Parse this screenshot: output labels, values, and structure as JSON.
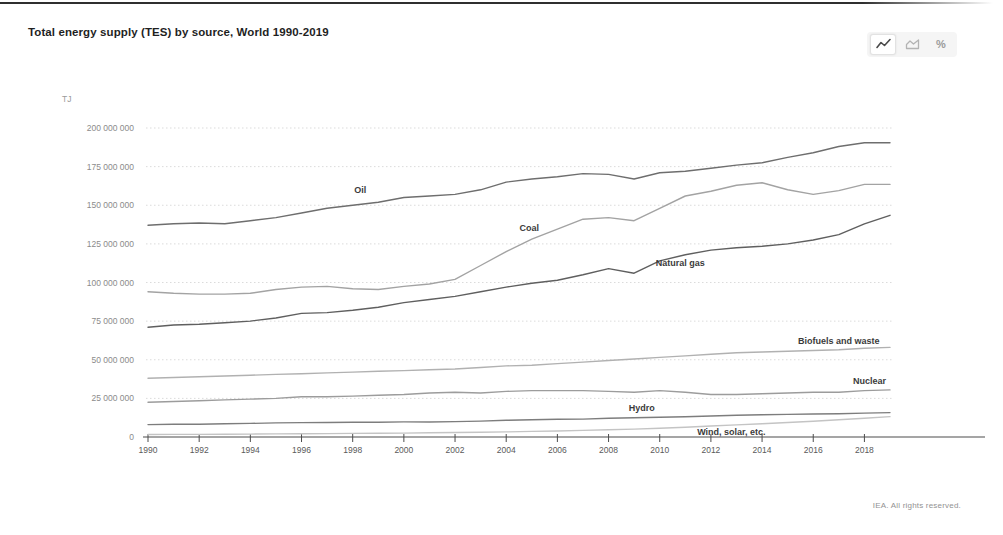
{
  "header": {
    "title": "Total energy supply (TES) by source, World 1990-2019"
  },
  "toolbar": {
    "percent_glyph": "%",
    "options": [
      {
        "id": "line-chart",
        "icon": "line-chart-icon",
        "selected": true
      },
      {
        "id": "area-chart",
        "icon": "area-chart-icon",
        "selected": false
      },
      {
        "id": "percent-chart",
        "icon": "percent-icon",
        "selected": false
      }
    ]
  },
  "footer": {
    "copyright": "IEA. All rights reserved."
  },
  "chart_data": {
    "type": "line",
    "title": "Total energy supply (TES) by source, World 1990-2019",
    "xlabel": "",
    "ylabel": "TJ",
    "values_unit": "million TJ",
    "xlim": [
      1990,
      2019
    ],
    "ylim": [
      0,
      200
    ],
    "grid": "horizontal-dotted",
    "legend": "inline-labels",
    "years": [
      1990,
      1991,
      1992,
      1993,
      1994,
      1995,
      1996,
      1997,
      1998,
      1999,
      2000,
      2001,
      2002,
      2003,
      2004,
      2005,
      2006,
      2007,
      2008,
      2009,
      2010,
      2011,
      2012,
      2013,
      2014,
      2015,
      2016,
      2017,
      2018,
      2019
    ],
    "x_ticks": [
      1990,
      1992,
      1994,
      1996,
      1998,
      2000,
      2002,
      2004,
      2006,
      2008,
      2010,
      2012,
      2014,
      2016,
      2018
    ],
    "y_ticks": [
      {
        "value": 200,
        "label": "200 000 000"
      },
      {
        "value": 175,
        "label": "175 000 000"
      },
      {
        "value": 150,
        "label": "150 000 000"
      },
      {
        "value": 125,
        "label": "125 000 000"
      },
      {
        "value": 100,
        "label": "100 000 000"
      },
      {
        "value": 75,
        "label": "75 000 000"
      },
      {
        "value": 50,
        "label": "50 000 000"
      },
      {
        "value": 25,
        "label": "25 000 000"
      },
      {
        "value": 0,
        "label": "0"
      }
    ],
    "series": [
      {
        "id": "oil",
        "name": "Oil",
        "color": "#6e6e6e",
        "label": {
          "year": 1998.3,
          "dy": -11
        },
        "values": [
          137,
          138,
          138.5,
          138,
          140,
          142,
          145,
          148,
          150,
          152,
          155,
          156,
          157,
          160,
          165,
          167,
          168.5,
          170.5,
          170,
          167,
          171,
          172,
          174,
          176,
          177.5,
          181,
          184,
          188,
          190.5,
          190.5
        ]
      },
      {
        "id": "coal",
        "name": "Coal",
        "color": "#a3a3a3",
        "label": {
          "year": 2004.9,
          "dy": -9
        },
        "values": [
          94,
          93,
          92.5,
          92.5,
          93,
          95.5,
          97,
          97.5,
          96,
          95.5,
          97.5,
          99,
          102,
          111,
          120,
          128,
          134.5,
          141,
          142,
          140,
          148,
          156,
          159,
          163,
          164.5,
          160,
          157,
          159.5,
          163.5,
          163.5
        ]
      },
      {
        "id": "natural-gas",
        "name": "Natural gas",
        "color": "#5f5f5f",
        "label": {
          "year": 2010.8,
          "dy": 10
        },
        "values": [
          71,
          72.5,
          73,
          74,
          75,
          77,
          80,
          80.5,
          82,
          84,
          87,
          89,
          91,
          94,
          97,
          99.5,
          101.5,
          105,
          109,
          106,
          114,
          118,
          121,
          122.5,
          123.5,
          125,
          127.5,
          131,
          138,
          143.5
        ]
      },
      {
        "id": "biofuels-waste",
        "name": "Biofuels and waste",
        "color": "#b1b1b1",
        "label": {
          "year": 2017,
          "dy": -6
        },
        "values": [
          38,
          38.5,
          39,
          39.5,
          40,
          40.5,
          41,
          41.5,
          42,
          42.5,
          43,
          43.5,
          44,
          45,
          46,
          46.5,
          47.5,
          48.5,
          49.5,
          50.5,
          51.5,
          52.5,
          53.5,
          54.5,
          55,
          55.5,
          56,
          56.5,
          57.5,
          58
        ]
      },
      {
        "id": "nuclear",
        "name": "Nuclear",
        "color": "#9c9c9c",
        "label": {
          "year": 2018.2,
          "dy": -6
        },
        "values": [
          22.5,
          23,
          23.5,
          24,
          24.5,
          25,
          26,
          26,
          26.5,
          27,
          27.5,
          28.5,
          29,
          28.5,
          29.5,
          30,
          30,
          30,
          29.5,
          29,
          30,
          29,
          27.5,
          27.5,
          28,
          28.5,
          29,
          29,
          30,
          30.5
        ]
      },
      {
        "id": "hydro",
        "name": "Hydro",
        "color": "#7d7d7d",
        "label": {
          "year": 2009.3,
          "dy": -7
        },
        "values": [
          8,
          8.2,
          8.3,
          8.6,
          8.8,
          9.1,
          9.3,
          9.4,
          9.5,
          9.6,
          9.8,
          9.7,
          10,
          10.3,
          10.8,
          11.2,
          11.5,
          11.6,
          12.1,
          12.4,
          12.8,
          13.1,
          13.6,
          14.1,
          14.4,
          14.6,
          14.9,
          15.1,
          15.5,
          15.8
        ]
      },
      {
        "id": "wind-solar",
        "name": "Wind, solar, etc.",
        "color": "#c4c4c4",
        "label": {
          "year": 2012.8,
          "dy": 10
        },
        "values": [
          1.6,
          1.7,
          1.7,
          1.8,
          1.9,
          2,
          2.1,
          2.2,
          2.3,
          2.4,
          2.5,
          2.7,
          2.9,
          3.1,
          3.3,
          3.6,
          3.9,
          4.3,
          4.7,
          5.1,
          5.6,
          6.3,
          7.1,
          7.8,
          8.6,
          9.4,
          10.2,
          11.2,
          12.2,
          13.2
        ]
      }
    ]
  }
}
